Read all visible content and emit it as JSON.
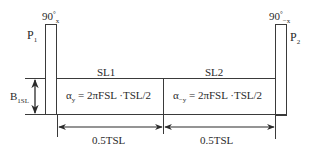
{
  "diagram": {
    "pulses": [
      {
        "name": "P",
        "index": "1",
        "angle": "90",
        "degree": "°",
        "phase": "x"
      },
      {
        "name": "P",
        "index": "2",
        "angle": "90",
        "degree": "°",
        "phase": "−x"
      }
    ],
    "spin_lock": [
      {
        "label": "SL1",
        "alpha_sym": "α",
        "alpha_sub": "y",
        "equation": " = 2πFSL ·TSL/2"
      },
      {
        "label": "SL2",
        "alpha_sym": "α",
        "alpha_sub": "−y",
        "equation": " = 2πFSL ·TSL/2"
      }
    ],
    "amplitude": {
      "symbol": "B",
      "sub": "1SL"
    },
    "durations": [
      "0.5TSL",
      "0.5TSL"
    ],
    "colors": {
      "line": "#3a3a3a",
      "text": "#2a2a2a",
      "background": "#ffffff"
    }
  }
}
